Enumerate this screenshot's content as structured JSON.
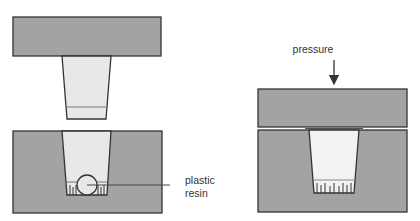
{
  "diagram": {
    "type": "compression-molding-process",
    "colors": {
      "mold": "#a3a3a3",
      "cavity": "#e8e8e8",
      "cavity_pressed": "#f2f2f2",
      "stroke": "#333333",
      "background": "#ffffff"
    },
    "panels": [
      {
        "id": "open-mold",
        "state": "open",
        "components": [
          "top-platen",
          "plunger",
          "bottom-mold",
          "cavity",
          "plastic-resin"
        ]
      },
      {
        "id": "closed-mold",
        "state": "closed",
        "components": [
          "top-platen",
          "bottom-mold",
          "cavity",
          "molded-part"
        ]
      }
    ],
    "labels": {
      "resin_line1": "plastic",
      "resin_line2": "resin",
      "pressure": "pressure"
    }
  }
}
